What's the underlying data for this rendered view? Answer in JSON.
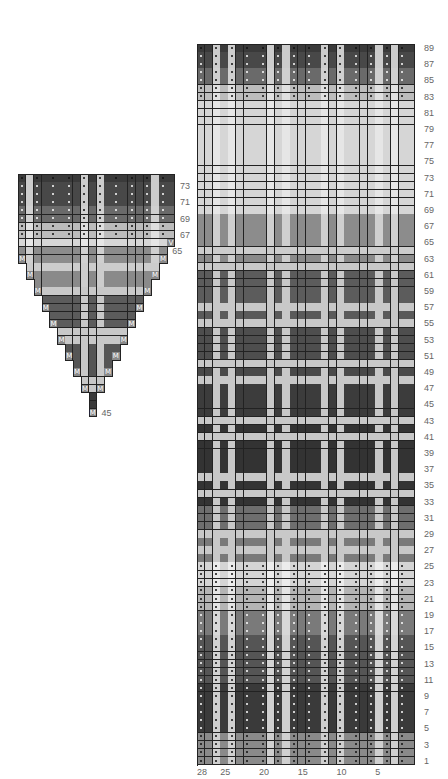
{
  "main_chart": {
    "columns": 28,
    "rows": 89,
    "origin": {
      "x": 197,
      "y": 44
    },
    "cell_w": 7.75,
    "cell_h": 8.1,
    "light_stripe_cols_from_left": [
      2,
      4,
      9,
      11,
      16,
      18,
      23,
      25
    ],
    "dot_cols_from_left": [
      0,
      2,
      4,
      6,
      8,
      10,
      12,
      14,
      16,
      18,
      20,
      22,
      24,
      26
    ],
    "dot_rows": [
      1,
      2,
      3,
      4,
      5,
      6,
      7,
      8,
      9,
      10,
      11,
      12,
      13,
      14,
      15,
      16,
      17,
      18,
      19,
      20,
      21,
      22,
      23,
      24,
      25,
      83,
      84,
      85,
      86,
      87,
      88,
      89
    ],
    "row_bands": [
      {
        "from": 1,
        "to": 4,
        "bg": "#8a8a8a",
        "stripe": "#cfcfcf",
        "dot": "#111111"
      },
      {
        "from": 5,
        "to": 10,
        "bg": "#3a3a3a",
        "stripe": "#cfcfcf",
        "dot": "#ffffff"
      },
      {
        "from": 11,
        "to": 16,
        "bg": "#555555",
        "stripe": "#d2d2d2",
        "dot": "#ffffff"
      },
      {
        "from": 17,
        "to": 19,
        "bg": "#7a7a7a",
        "stripe": "#d8d8d8",
        "dot": "#ffffff"
      },
      {
        "from": 20,
        "to": 22,
        "bg": "#b4b4b4",
        "stripe": "#e4e4e4",
        "dot": "#111111"
      },
      {
        "from": 23,
        "to": 25,
        "bg": "#d4d4d4",
        "stripe": "#ececec",
        "dot": "#111111"
      },
      {
        "from": 26,
        "to": 26,
        "bg": "#7a7a7a",
        "stripe": "#c8c8c8",
        "dot": ""
      },
      {
        "from": 27,
        "to": 27,
        "bg": "#c8c8c8",
        "stripe": "#c8c8c8",
        "dot": ""
      },
      {
        "from": 28,
        "to": 28,
        "bg": "#7a7a7a",
        "stripe": "#c8c8c8",
        "dot": ""
      },
      {
        "from": 29,
        "to": 29,
        "bg": "#c8c8c8",
        "stripe": "#c8c8c8",
        "dot": ""
      },
      {
        "from": 30,
        "to": 32,
        "bg": "#6e6e6e",
        "stripe": "#c8c8c8",
        "dot": ""
      },
      {
        "from": 33,
        "to": 33,
        "bg": "#333333",
        "stripe": "#c8c8c8",
        "dot": ""
      },
      {
        "from": 34,
        "to": 34,
        "bg": "#c8c8c8",
        "stripe": "#c8c8c8",
        "dot": ""
      },
      {
        "from": 35,
        "to": 35,
        "bg": "#333333",
        "stripe": "#c8c8c8",
        "dot": ""
      },
      {
        "from": 36,
        "to": 36,
        "bg": "#c8c8c8",
        "stripe": "#c8c8c8",
        "dot": ""
      },
      {
        "from": 37,
        "to": 40,
        "bg": "#333333",
        "stripe": "#c8c8c8",
        "dot": ""
      },
      {
        "from": 41,
        "to": 41,
        "bg": "#c8c8c8",
        "stripe": "#c8c8c8",
        "dot": ""
      },
      {
        "from": 42,
        "to": 42,
        "bg": "#333333",
        "stripe": "#c8c8c8",
        "dot": ""
      },
      {
        "from": 43,
        "to": 43,
        "bg": "#c8c8c8",
        "stripe": "#c8c8c8",
        "dot": ""
      },
      {
        "from": 44,
        "to": 47,
        "bg": "#3c3c3c",
        "stripe": "#c8c8c8",
        "dot": ""
      },
      {
        "from": 48,
        "to": 48,
        "bg": "#c8c8c8",
        "stripe": "#c8c8c8",
        "dot": ""
      },
      {
        "from": 49,
        "to": 49,
        "bg": "#4a4a4a",
        "stripe": "#c8c8c8",
        "dot": ""
      },
      {
        "from": 50,
        "to": 50,
        "bg": "#c8c8c8",
        "stripe": "#c8c8c8",
        "dot": ""
      },
      {
        "from": 51,
        "to": 54,
        "bg": "#4e4e4e",
        "stripe": "#c8c8c8",
        "dot": ""
      },
      {
        "from": 55,
        "to": 55,
        "bg": "#c8c8c8",
        "stripe": "#c8c8c8",
        "dot": ""
      },
      {
        "from": 56,
        "to": 56,
        "bg": "#5a5a5a",
        "stripe": "#c8c8c8",
        "dot": ""
      },
      {
        "from": 57,
        "to": 57,
        "bg": "#c8c8c8",
        "stripe": "#c8c8c8",
        "dot": ""
      },
      {
        "from": 58,
        "to": 61,
        "bg": "#5c5c5c",
        "stripe": "#c8c8c8",
        "dot": ""
      },
      {
        "from": 62,
        "to": 62,
        "bg": "#c8c8c8",
        "stripe": "#c8c8c8",
        "dot": ""
      },
      {
        "from": 63,
        "to": 63,
        "bg": "#8a8a8a",
        "stripe": "#cccccc",
        "dot": ""
      },
      {
        "from": 64,
        "to": 64,
        "bg": "#cccccc",
        "stripe": "#cccccc",
        "dot": ""
      },
      {
        "from": 65,
        "to": 68,
        "bg": "#8c8c8c",
        "stripe": "#cfcfcf",
        "dot": ""
      },
      {
        "from": 69,
        "to": 82,
        "bg": "#d6d6d6",
        "stripe": "#e6e6e6",
        "dot": ""
      },
      {
        "from": 83,
        "to": 84,
        "bg": "#bcbcbc",
        "stripe": "#e0e0e0",
        "dot": "#111111"
      },
      {
        "from": 85,
        "to": 86,
        "bg": "#6a6a6a",
        "stripe": "#d0d0d0",
        "dot": "#ffffff"
      },
      {
        "from": 87,
        "to": 88,
        "bg": "#484848",
        "stripe": "#cccccc",
        "dot": "#ffffff"
      },
      {
        "from": 89,
        "to": 89,
        "bg": "#3a3a3a",
        "stripe": "#cccccc",
        "dot": "#111111"
      }
    ],
    "row_labels": [
      "1",
      "3",
      "5",
      "7",
      "9",
      "11",
      "13",
      "15",
      "17",
      "19",
      "21",
      "23",
      "25",
      "27",
      "29",
      "31",
      "33",
      "35",
      "37",
      "39",
      "41",
      "43",
      "45",
      "47",
      "49",
      "51",
      "53",
      "55",
      "57",
      "59",
      "61",
      "63",
      "65",
      "67",
      "69",
      "71",
      "73",
      "75",
      "77",
      "79",
      "81",
      "83",
      "85",
      "87",
      "89"
    ],
    "col_labels": [
      {
        "text": "28",
        "col": 28
      },
      {
        "text": "25",
        "col": 25
      },
      {
        "text": "20",
        "col": 20
      },
      {
        "text": "15",
        "col": 15
      },
      {
        "text": "10",
        "col": 10
      },
      {
        "text": "5",
        "col": 5
      }
    ]
  },
  "gusset_chart": {
    "columns": 20,
    "top_row": 74,
    "bottom_row": 45,
    "origin": {
      "x": 18,
      "y": 174
    },
    "cell_w": 7.85,
    "cell_h": 8.1,
    "light_stripe_cols_from_left": [
      1,
      8,
      10,
      17
    ],
    "dot_cols_from_left": [
      0,
      2,
      4,
      6,
      8,
      10,
      12,
      14,
      16,
      18
    ],
    "dot_rows": [
      67,
      68,
      69,
      70,
      71,
      72,
      73,
      74
    ],
    "row_extent": [
      {
        "row": 74,
        "start": 0,
        "end": 19
      },
      {
        "row": 73,
        "start": 0,
        "end": 19
      },
      {
        "row": 72,
        "start": 0,
        "end": 19
      },
      {
        "row": 71,
        "start": 0,
        "end": 19
      },
      {
        "row": 70,
        "start": 0,
        "end": 19
      },
      {
        "row": 69,
        "start": 0,
        "end": 19
      },
      {
        "row": 68,
        "start": 0,
        "end": 19
      },
      {
        "row": 67,
        "start": 0,
        "end": 19
      },
      {
        "row": 66,
        "start": 0,
        "end": 19
      },
      {
        "row": 65,
        "start": 0,
        "end": 18
      },
      {
        "row": 64,
        "start": 0,
        "end": 18
      },
      {
        "row": 63,
        "start": 1,
        "end": 17
      },
      {
        "row": 62,
        "start": 1,
        "end": 17
      },
      {
        "row": 61,
        "start": 2,
        "end": 16
      },
      {
        "row": 60,
        "start": 2,
        "end": 16
      },
      {
        "row": 59,
        "start": 3,
        "end": 15
      },
      {
        "row": 58,
        "start": 3,
        "end": 15
      },
      {
        "row": 57,
        "start": 4,
        "end": 14
      },
      {
        "row": 56,
        "start": 4,
        "end": 14
      },
      {
        "row": 55,
        "start": 5,
        "end": 13
      },
      {
        "row": 54,
        "start": 5,
        "end": 13
      },
      {
        "row": 53,
        "start": 6,
        "end": 12
      },
      {
        "row": 52,
        "start": 6,
        "end": 12
      },
      {
        "row": 51,
        "start": 7,
        "end": 11
      },
      {
        "row": 50,
        "start": 7,
        "end": 11
      },
      {
        "row": 49,
        "start": 8,
        "end": 10
      },
      {
        "row": 48,
        "start": 8,
        "end": 10
      },
      {
        "row": 47,
        "start": 9,
        "end": 9
      },
      {
        "row": 46,
        "start": 9,
        "end": 9
      },
      {
        "row": 45,
        "start": 9,
        "end": 9
      }
    ],
    "marks": [
      {
        "row": 66,
        "col": 19,
        "symbol": "V"
      },
      {
        "row": 64,
        "col": 0,
        "symbol": "M"
      },
      {
        "row": 64,
        "col": 18,
        "symbol": "M"
      },
      {
        "row": 62,
        "col": 1,
        "symbol": "M"
      },
      {
        "row": 62,
        "col": 17,
        "symbol": "M"
      },
      {
        "row": 60,
        "col": 2,
        "symbol": "M"
      },
      {
        "row": 60,
        "col": 16,
        "symbol": "M"
      },
      {
        "row": 58,
        "col": 3,
        "symbol": "M"
      },
      {
        "row": 58,
        "col": 15,
        "symbol": "M"
      },
      {
        "row": 56,
        "col": 4,
        "symbol": "M"
      },
      {
        "row": 56,
        "col": 14,
        "symbol": "M"
      },
      {
        "row": 54,
        "col": 5,
        "symbol": "M"
      },
      {
        "row": 54,
        "col": 13,
        "symbol": "M"
      },
      {
        "row": 52,
        "col": 6,
        "symbol": "M"
      },
      {
        "row": 52,
        "col": 12,
        "symbol": "M"
      },
      {
        "row": 50,
        "col": 7,
        "symbol": "M"
      },
      {
        "row": 50,
        "col": 11,
        "symbol": "M"
      },
      {
        "row": 48,
        "col": 8,
        "symbol": "M"
      },
      {
        "row": 48,
        "col": 10,
        "symbol": "M"
      },
      {
        "row": 45,
        "col": 9,
        "symbol": "M"
      }
    ],
    "row_bands": [
      {
        "from": 45,
        "to": 47,
        "bg": "#3a3a3a",
        "stripe": "#c8c8c8",
        "dot": ""
      },
      {
        "from": 48,
        "to": 49,
        "bg": "#c8c8c8",
        "stripe": "#c8c8c8",
        "dot": ""
      },
      {
        "from": 50,
        "to": 53,
        "bg": "#555555",
        "stripe": "#c8c8c8",
        "dot": ""
      },
      {
        "from": 54,
        "to": 55,
        "bg": "#c8c8c8",
        "stripe": "#c8c8c8",
        "dot": ""
      },
      {
        "from": 56,
        "to": 59,
        "bg": "#5c5c5c",
        "stripe": "#c8c8c8",
        "dot": ""
      },
      {
        "from": 60,
        "to": 60,
        "bg": "#c8c8c8",
        "stripe": "#c8c8c8",
        "dot": ""
      },
      {
        "from": 61,
        "to": 62,
        "bg": "#8a8a8a",
        "stripe": "#cccccc",
        "dot": ""
      },
      {
        "from": 63,
        "to": 63,
        "bg": "#cccccc",
        "stripe": "#cccccc",
        "dot": ""
      },
      {
        "from": 64,
        "to": 65,
        "bg": "#8c8c8c",
        "stripe": "#cfcfcf",
        "dot": ""
      },
      {
        "from": 66,
        "to": 66,
        "bg": "#d6d6d6",
        "stripe": "#e6e6e6",
        "dot": ""
      },
      {
        "from": 67,
        "to": 68,
        "bg": "#bcbcbc",
        "stripe": "#e0e0e0",
        "dot": "#111111"
      },
      {
        "from": 69,
        "to": 70,
        "bg": "#6a6a6a",
        "stripe": "#d0d0d0",
        "dot": "#ffffff"
      },
      {
        "from": 71,
        "to": 73,
        "bg": "#484848",
        "stripe": "#cccccc",
        "dot": "#ffffff"
      },
      {
        "from": 74,
        "to": 74,
        "bg": "#3a3a3a",
        "stripe": "#cccccc",
        "dot": "#111111"
      }
    ],
    "row_labels": [
      {
        "text": "73",
        "row": 73
      },
      {
        "text": "71",
        "row": 71
      },
      {
        "text": "69",
        "row": 69
      },
      {
        "text": "67",
        "row": 67
      },
      {
        "text": "65",
        "row": 65
      },
      {
        "text": "45",
        "row": 45
      }
    ]
  }
}
